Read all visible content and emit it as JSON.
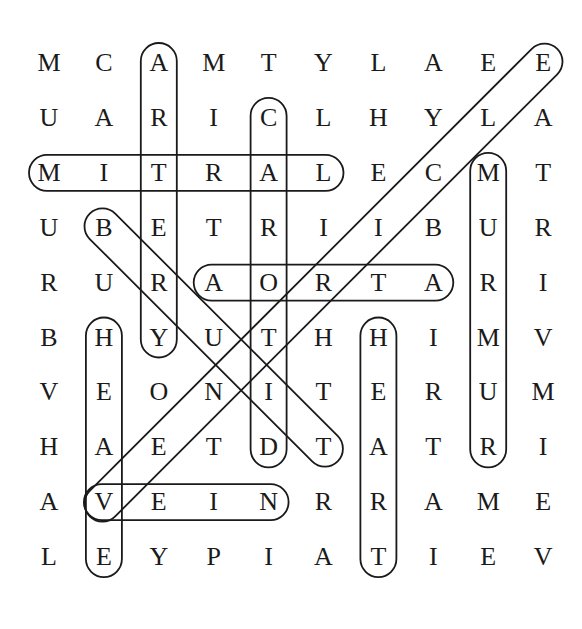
{
  "puzzle": {
    "grid": [
      [
        "M",
        "C",
        "A",
        "M",
        "T",
        "Y",
        "L",
        "A",
        "E",
        "E"
      ],
      [
        "U",
        "A",
        "R",
        "I",
        "C",
        "L",
        "H",
        "Y",
        "L",
        "A"
      ],
      [
        "M",
        "I",
        "T",
        "R",
        "A",
        "L",
        "E",
        "C",
        "M",
        "T"
      ],
      [
        "U",
        "B",
        "E",
        "T",
        "R",
        "I",
        "I",
        "B",
        "U",
        "R"
      ],
      [
        "R",
        "U",
        "R",
        "A",
        "O",
        "R",
        "T",
        "A",
        "R",
        "I"
      ],
      [
        "B",
        "H",
        "Y",
        "U",
        "T",
        "H",
        "H",
        "I",
        "M",
        "V"
      ],
      [
        "V",
        "E",
        "O",
        "N",
        "I",
        "T",
        "E",
        "R",
        "U",
        "M"
      ],
      [
        "H",
        "A",
        "E",
        "T",
        "D",
        "T",
        "A",
        "T",
        "R",
        "I"
      ],
      [
        "A",
        "V",
        "E",
        "I",
        "N",
        "R",
        "R",
        "A",
        "M",
        "E"
      ],
      [
        "L",
        "E",
        "Y",
        "P",
        "I",
        "A",
        "T",
        "I",
        "E",
        "V"
      ]
    ],
    "found_words": [
      {
        "word": "ARTERY",
        "start": [
          0,
          2
        ],
        "end": [
          5,
          2
        ]
      },
      {
        "word": "CAROTID",
        "start": [
          1,
          4
        ],
        "end": [
          7,
          4
        ]
      },
      {
        "word": "MITRAL",
        "start": [
          2,
          0
        ],
        "end": [
          2,
          5
        ]
      },
      {
        "word": "MURMUR",
        "start": [
          2,
          8
        ],
        "end": [
          7,
          8
        ]
      },
      {
        "word": "BRUIT",
        "start": [
          3,
          1
        ],
        "end": [
          7,
          5
        ]
      },
      {
        "word": "AORTA",
        "start": [
          4,
          3
        ],
        "end": [
          4,
          7
        ]
      },
      {
        "word": "HEAVE",
        "start": [
          5,
          1
        ],
        "end": [
          9,
          1
        ]
      },
      {
        "word": "HEART",
        "start": [
          5,
          6
        ],
        "end": [
          9,
          6
        ]
      },
      {
        "word": "VEIN",
        "start": [
          8,
          1
        ],
        "end": [
          8,
          4
        ]
      },
      {
        "word": "VALVE",
        "start": [
          0,
          9
        ],
        "end": [
          8,
          1
        ]
      }
    ],
    "colors": {
      "ink": "#1a1a1a",
      "background": "#ffffff"
    }
  }
}
